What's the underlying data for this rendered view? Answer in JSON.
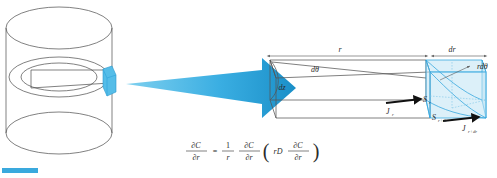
{
  "figure": {
    "title_visible": false,
    "background_color": "#ffffff",
    "accent_blue": "#38a8de",
    "line_color": "#4a4a4a"
  },
  "left_panel": {
    "name": "cylinder-schematic",
    "description": "Hollow cylinder with an annular ring and a highlighted differential volume element",
    "highlight_color": "#55bde8"
  },
  "transition_arrow": {
    "name": "zoom-in-arrow",
    "color_light": "#56bfe9",
    "color_dark": "#1a8fc8",
    "direction": "right"
  },
  "right_panel": {
    "name": "differential-element",
    "labels": {
      "radius": "r",
      "radius_increment": "dr",
      "angle": "dθ",
      "height": "dz",
      "arc_length": "rdθ",
      "flux_in": "J",
      "flux_in_sub": "r",
      "flux_out": "J",
      "flux_out_sub": "r+dr",
      "area_in": "S",
      "area_in_sub": "r",
      "area_out": "S",
      "area_out_sub": "r+dr"
    }
  },
  "equation": {
    "name": "diffusion-equation",
    "lhs_num": "∂C",
    "lhs_den": "∂r",
    "equals": "=",
    "coef_num": "1",
    "coef_den": "r",
    "op_num": "∂C",
    "op_den": "∂r",
    "paren_open": "(",
    "inner_prefix": "rD",
    "inner_num": "∂C",
    "inner_den": "∂r",
    "paren_close": ")"
  },
  "footer": {
    "name": "page-accent-bar",
    "color": "#3aa9dd"
  }
}
